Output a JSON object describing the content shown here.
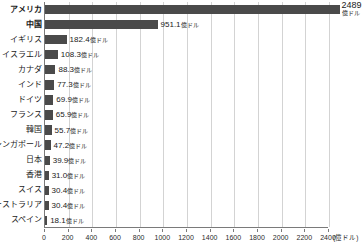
{
  "chart_data": {
    "type": "bar",
    "orientation": "horizontal",
    "title": "",
    "subtitle": "",
    "xlabel": "(億ドル)",
    "ylabel": "",
    "xlim": [
      0,
      2400
    ],
    "grid": true,
    "legend": null,
    "unit_suffix": "億ドル",
    "axis_unit_label": "(億ドル)",
    "xticks": [
      0,
      200,
      400,
      600,
      800,
      1000,
      1200,
      1400,
      1600,
      1800,
      2000,
      2200,
      2400
    ],
    "xtick_labels": [
      "0",
      "200",
      "400",
      "600",
      "800",
      "1000",
      "1200",
      "1400",
      "1600",
      "1800",
      "2000",
      "2200",
      "2400"
    ],
    "categories": [
      "アメリカ",
      "中国",
      "イギリス",
      "イスラエル",
      "カナダ",
      "インド",
      "ドイツ",
      "フランス",
      "韓国",
      "シンガポール",
      "日本",
      "香港",
      "スイス",
      "オーストラリア",
      "スペイン"
    ],
    "values": [
      2489,
      951.1,
      182.4,
      108.3,
      88.3,
      77.3,
      69.9,
      65.9,
      55.7,
      47.2,
      39.9,
      31.0,
      30.4,
      30.4,
      18.1
    ],
    "value_labels": [
      "2489",
      "951.1億ドル",
      "182.4億ドル",
      "108.3億ドル",
      "88.3億ドル",
      "77.3億ドル",
      "69.9億ドル",
      "65.9億ドル",
      "55.7億ドル",
      "47.2億ドル",
      "39.9億ドル",
      "31.0億ドル",
      "30.4億ドル",
      "30.4億ドル",
      "18.1億ドル"
    ],
    "bold_categories": [
      "アメリカ",
      "中国"
    ],
    "colors": {
      "bar": "#4a4a4a",
      "grid": "#d3d3d3",
      "axis": "#7a7a7a",
      "text": "#1a1a1a",
      "background": "#ffffff"
    }
  }
}
